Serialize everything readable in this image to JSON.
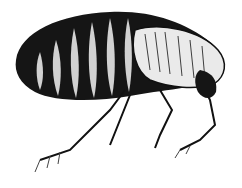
{
  "image": {
    "subject": "flea engraving",
    "style": "black and white illustration",
    "background": "#ffffff",
    "ink": "#111111"
  }
}
